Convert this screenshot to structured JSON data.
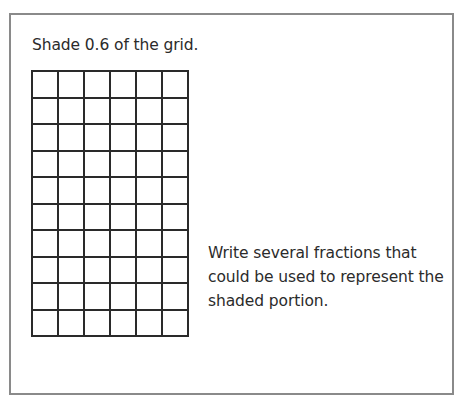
{
  "worksheet": {
    "prompt": "Shade 0.6 of the grid.",
    "question": "Write several fractions that could be used to represent the shaded portion.",
    "grid": {
      "rows": 10,
      "columns": 6,
      "shaded_cells": 0,
      "cell_width_px": 26,
      "cell_height_px": 26.5
    },
    "footer_clipped_text": "For 0.6 fill ... and ... ... ... ... ... ... ... ... ..."
  },
  "colors": {
    "border": "#8a8a8a",
    "grid_line": "#2a2a2a",
    "text": "#2b2b2b",
    "background": "#ffffff"
  }
}
